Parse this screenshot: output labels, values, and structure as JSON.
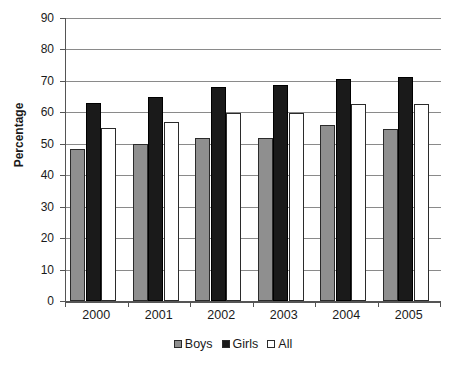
{
  "chart_data": {
    "type": "bar",
    "title": "",
    "subtitle": "",
    "xlabel": "",
    "ylabel": "Percentage",
    "ylim": [
      0,
      90
    ],
    "y_ticks": [
      0,
      10,
      20,
      30,
      40,
      50,
      60,
      70,
      80,
      90
    ],
    "grid": true,
    "grid_axis": "y",
    "legend_position": "bottom",
    "categories": [
      "2000",
      "2001",
      "2002",
      "2003",
      "2004",
      "2005"
    ],
    "series": [
      {
        "name": "Boys",
        "color": "#8f8f8f",
        "values": [
          48.3,
          50.0,
          52.0,
          51.8,
          56.0,
          54.7
        ]
      },
      {
        "name": "Girls",
        "color": "#1a1a1a",
        "values": [
          63.0,
          65.0,
          68.0,
          68.6,
          70.7,
          71.3
        ]
      },
      {
        "name": "All",
        "color": "#ffffff",
        "values": [
          55.0,
          57.0,
          59.8,
          59.8,
          62.6,
          62.5
        ]
      }
    ],
    "annotations": []
  },
  "legend": {
    "items": [
      {
        "label": "Boys"
      },
      {
        "label": "Girls"
      },
      {
        "label": "All"
      }
    ]
  },
  "axes": {
    "y_title": "Percentage"
  }
}
